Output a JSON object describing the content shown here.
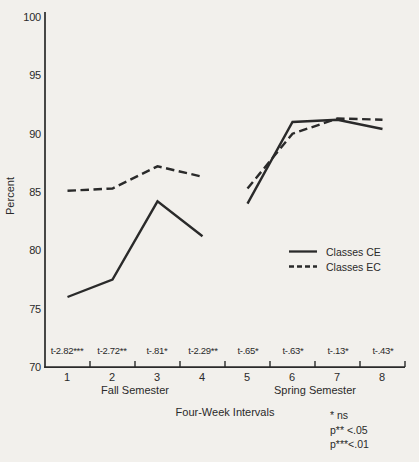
{
  "figure": {
    "background": "#f2f0ec",
    "ink": "#2a2a2a"
  },
  "chart_data": {
    "type": "line",
    "title": "",
    "xlabel": "Four-Week Intervals",
    "ylabel": "Percent",
    "ylim": [
      70,
      100
    ],
    "grid": false,
    "legend_position": "right-middle",
    "y_ticks": [
      100,
      95,
      90,
      85,
      80,
      75,
      70
    ],
    "x_categories": [
      "1",
      "2",
      "3",
      "4",
      "5",
      "6",
      "7",
      "8"
    ],
    "x_group_labels": [
      "Fall Semester",
      "Spring Semester"
    ],
    "series": [
      {
        "name": "Classes CE",
        "style": "solid",
        "segments": [
          [
            76,
            77.5,
            84.2,
            81.2
          ],
          [
            84,
            91,
            91.2,
            90.4
          ]
        ]
      },
      {
        "name": "Classes EC",
        "style": "dashed",
        "segments": [
          [
            85.1,
            85.3,
            87.2,
            86.3
          ],
          [
            85.3,
            90,
            91.3,
            91.2
          ]
        ]
      }
    ],
    "annotations": [
      "t-2.82***",
      "t-2.72**",
      "t-.81*",
      "t-2.29**",
      "t-.65*",
      "t-.63*",
      "t-.13*",
      "t-.43*"
    ],
    "footnotes": [
      "* ns",
      "p** <.05",
      "p***<.01"
    ]
  }
}
